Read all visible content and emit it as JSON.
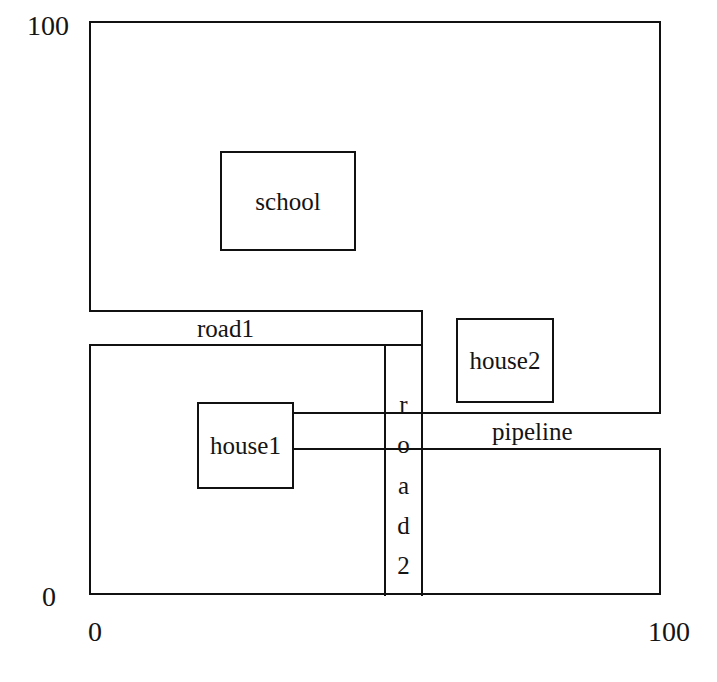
{
  "diagram": {
    "axes": {
      "y_max_label": "100",
      "y_min_label": "0",
      "x_min_label": "0",
      "x_max_label": "100"
    },
    "stroke_color": "#111111",
    "background_color": "#ffffff",
    "objects": [
      {
        "id": "school",
        "label": "school",
        "shape": "rectangle"
      },
      {
        "id": "road1",
        "label": "road1",
        "shape": "band-horizontal"
      },
      {
        "id": "road2",
        "label": "road2",
        "shape": "band-vertical",
        "letters": [
          "r",
          "o",
          "a",
          "d",
          "2"
        ]
      },
      {
        "id": "house2",
        "label": "house2",
        "shape": "rectangle"
      },
      {
        "id": "pipeline",
        "label": "pipeline",
        "shape": "band-horizontal"
      },
      {
        "id": "house1",
        "label": "house1",
        "shape": "rectangle"
      }
    ]
  },
  "chart_data": {
    "type": "diagram",
    "title": "",
    "xlabel": "",
    "ylabel": "",
    "xlim": [
      0,
      100
    ],
    "ylim": [
      0,
      100
    ],
    "grid": false,
    "legend": "none",
    "shapes": [
      {
        "name": "school",
        "kind": "rectangle",
        "x": 23,
        "y": 60,
        "width": 24,
        "height": 17
      },
      {
        "name": "road1",
        "kind": "rectangle",
        "x": 0,
        "y": 44,
        "width": 58,
        "height": 6
      },
      {
        "name": "road2",
        "kind": "rectangle",
        "x": 52,
        "y": 0,
        "width": 7,
        "height": 44
      },
      {
        "name": "house2",
        "kind": "rectangle",
        "x": 64,
        "y": 34,
        "width": 17,
        "height": 15
      },
      {
        "name": "pipeline",
        "kind": "rectangle",
        "x": 36,
        "y": 25,
        "width": 64,
        "height": 7
      },
      {
        "name": "house1",
        "kind": "rectangle",
        "x": 19,
        "y": 18,
        "width": 17,
        "height": 15
      }
    ]
  }
}
